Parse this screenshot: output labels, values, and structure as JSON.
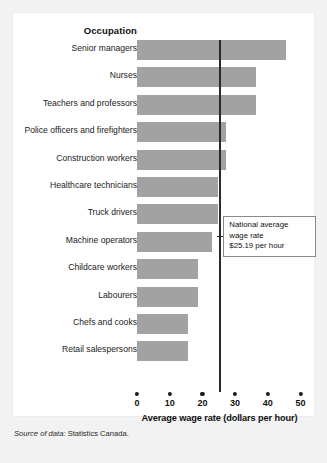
{
  "panel": {
    "column_header": "Occupation"
  },
  "chart_data": {
    "type": "bar",
    "orientation": "horizontal",
    "title": "",
    "xlabel": "Average wage rate (dollars per hour)",
    "ylabel": "Occupation",
    "xlim": [
      0,
      50
    ],
    "xticks": [
      0,
      10,
      20,
      30,
      40,
      50
    ],
    "xtick_labels": [
      "0",
      "10",
      "20",
      "30",
      "40",
      "50"
    ],
    "grid": false,
    "legend": "none",
    "bar_color": "#a2a2a2",
    "categories": [
      "Senior managers",
      "Nurses",
      "Teachers and professors",
      "Police officers and firefighters",
      "Construction workers",
      "Healthcare technicians",
      "Truck drivers",
      "Machine operators",
      "Childcare workers",
      "Labourers",
      "Chefs and cooks",
      "Retail salespersons"
    ],
    "values": [
      45.7,
      36.4,
      36.4,
      27.3,
      27.3,
      24.9,
      24.9,
      22.8,
      18.6,
      18.6,
      15.7,
      15.7
    ],
    "reference_line": {
      "value": 25.19,
      "color": "#2b2b2b",
      "annotation_line1": "National average",
      "annotation_line2": "wage rate",
      "annotation_line3": "$25.19 per hour"
    }
  },
  "source": {
    "lead": "Source of data:",
    "text": " Statistics Canada."
  }
}
